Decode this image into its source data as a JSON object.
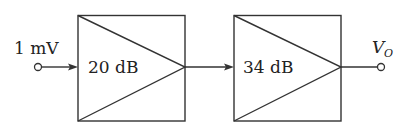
{
  "diagram": {
    "type": "cascaded-amplifier-block-diagram",
    "input": {
      "label": "1 mV"
    },
    "stages": [
      {
        "gain_label": "20 dB"
      },
      {
        "gain_label": "34 dB"
      }
    ],
    "output": {
      "symbol": "V",
      "subscript": "O"
    }
  }
}
